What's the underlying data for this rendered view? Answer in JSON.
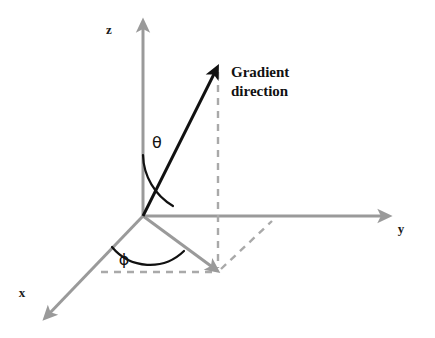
{
  "figure": {
    "kind": "3d-spherical-coordinate-diagram",
    "background_color": "#ffffff",
    "width": 435,
    "height": 338
  },
  "axes": {
    "color": "#9a9a9a",
    "stroke_width": 3,
    "items": [
      {
        "id": "z",
        "label": "z",
        "label_x": 109,
        "label_y": 34,
        "direction": "up",
        "from": [
          143,
          216
        ],
        "to": [
          143,
          22
        ]
      },
      {
        "id": "y",
        "label": "y",
        "label_x": 401,
        "label_y": 233,
        "direction": "right",
        "from": [
          143,
          216
        ],
        "to": [
          389,
          216
        ]
      },
      {
        "id": "x",
        "label": "x",
        "label_x": 22,
        "label_y": 297,
        "direction": "down-left",
        "from": [
          143,
          216
        ],
        "to": [
          44,
          319
        ]
      }
    ]
  },
  "vector": {
    "id": "gradient-direction",
    "color": "#111111",
    "stroke_width": 3,
    "from": [
      143,
      216
    ],
    "to": [
      218,
      66
    ],
    "label_line_1": "Gradient",
    "label_line_2": "direction",
    "label_x": 231,
    "label_y": 77
  },
  "angles": [
    {
      "id": "theta",
      "symbol": "θ",
      "label_x": 157,
      "label_y": 148,
      "description": "polar angle between z-axis and gradient direction",
      "arc_color": "#111111",
      "arc_stroke_width": 2.2
    },
    {
      "id": "phi",
      "symbol": "ϕ",
      "label_x": 124,
      "label_y": 265,
      "description": "azimuthal angle in xy-plane from x-axis to projection",
      "arc_color": "#111111",
      "arc_stroke_width": 2.2
    }
  ],
  "projection": {
    "id": "xy-plane-projection",
    "color": "#9a9a9a",
    "stroke_width": 3,
    "from": [
      143,
      216
    ],
    "to": [
      218,
      272
    ],
    "has_arrowhead": true
  },
  "dashed_guides": {
    "color": "#a9a9a9",
    "stroke_width": 2.4,
    "dash_pattern": "7 6",
    "segments": [
      {
        "id": "vertical-drop-from-vector-tip",
        "from": [
          218,
          70
        ],
        "to": [
          218,
          272
        ]
      },
      {
        "id": "to-y-axis",
        "from": [
          218,
          272
        ],
        "to": [
          272,
          221
        ]
      },
      {
        "id": "to-x-axis",
        "from": [
          215,
          272
        ],
        "to": [
          97,
          272
        ]
      }
    ]
  },
  "accessibility": {
    "title": "Gradient direction spherical coordinates diagram",
    "summary": "A three-dimensional Cartesian coordinate system with axes x, y and z. A black arrow labelled Gradient direction points up and to the right from the origin. The angle theta is measured from the z-axis to the arrow, and the angle phi is measured in the x-y plane from the x-axis to the arrow's projection."
  }
}
